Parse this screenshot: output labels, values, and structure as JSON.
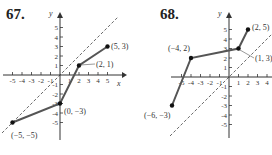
{
  "problems": [
    {
      "number": "67.",
      "xlabel": "x",
      "ylabel": "y",
      "points": [
        {
          "x": -5,
          "y": -5,
          "label": "(−5, −5)"
        },
        {
          "x": 0,
          "y": -3,
          "label": "(0, −3)"
        },
        {
          "x": 2,
          "y": 1,
          "label": "(2, 1)"
        },
        {
          "x": 5,
          "y": 3,
          "label": "(5, 3)"
        }
      ],
      "x_ticks": [
        "-5",
        "-4",
        "-3",
        "-2",
        "-1",
        "1",
        "2",
        "3",
        "4",
        "5"
      ],
      "y_ticks": [
        "-5",
        "-4",
        "-3",
        "-2",
        "-1",
        "1",
        "2",
        "3",
        "4",
        "5"
      ],
      "reference_line": "y = x (dashed)"
    },
    {
      "number": "68.",
      "xlabel": "x",
      "ylabel": "y",
      "points": [
        {
          "x": -6,
          "y": -3,
          "label": "(−6, −3)"
        },
        {
          "x": -4,
          "y": 2,
          "label": "(−4, 2)"
        },
        {
          "x": 1,
          "y": 3,
          "label": "(1, 3)"
        },
        {
          "x": 2,
          "y": 5,
          "label": "(2, 5)"
        }
      ],
      "x_ticks": [
        "-5",
        "-4",
        "-3",
        "-2",
        "-1",
        "1",
        "2",
        "3",
        "4"
      ],
      "y_ticks": [
        "-5",
        "-4",
        "-3",
        "-2",
        "-1",
        "1",
        "2",
        "3",
        "4",
        "5"
      ],
      "reference_line": "y = x (dashed)"
    }
  ]
}
